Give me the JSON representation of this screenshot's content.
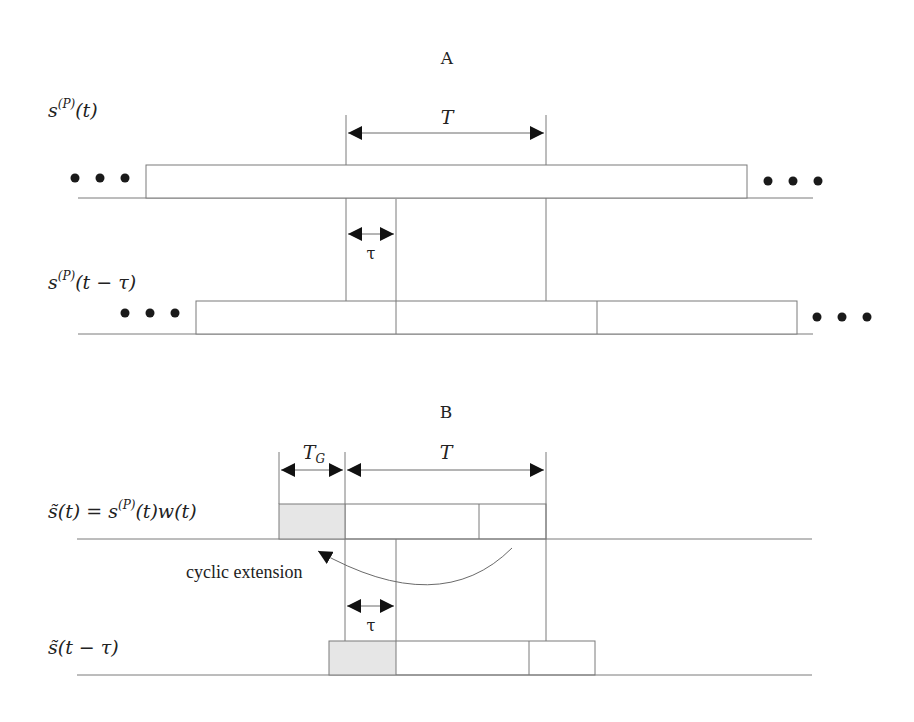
{
  "diagram": {
    "type": "signal-timing-diagram",
    "sections": [
      {
        "id": "A",
        "title": "A",
        "period_label": "T",
        "delay_label": "τ",
        "signals": [
          {
            "label": "s^(P)(t)",
            "label_main": "s",
            "label_sup": "(P)",
            "label_arg": "(t)",
            "leading_ellipsis": "• • •",
            "trailing_ellipsis": "• • •"
          },
          {
            "label": "s^(P)(t − τ)",
            "label_main": "s",
            "label_sup": "(P)",
            "label_arg": "(t − τ)",
            "leading_ellipsis": "• • •",
            "trailing_ellipsis": "• • •"
          }
        ]
      },
      {
        "id": "B",
        "title": "B",
        "guard_label": "T",
        "guard_sub": "G",
        "period_label": "T",
        "delay_label": "τ",
        "annotation": "cyclic extension",
        "signals": [
          {
            "label": "s̃(t) = s^(P)(t)w(t)",
            "label_main": "s̃(t) = s",
            "label_sup": "(P)",
            "label_arg": "(t)w(t)"
          },
          {
            "label": "s̃(t − τ)",
            "label_main": "s̃(t − τ)"
          }
        ]
      }
    ],
    "colors": {
      "line": "#7a7a7a",
      "arrowhead": "#111111",
      "shade": "#e6e6e6",
      "text": "#222222"
    }
  }
}
